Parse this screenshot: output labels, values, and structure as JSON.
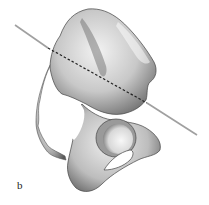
{
  "figure": {
    "panel_label": "b",
    "colors": {
      "background": "#ffffff",
      "bone_light": "#e8e8e8",
      "bone_mid": "#b8b8b8",
      "bone_dark": "#555555",
      "axis_line": "#a0a0a0",
      "axis_dashed": "#222222"
    },
    "axis": {
      "start": [
        15,
        25
      ],
      "end": [
        197,
        135
      ],
      "dashed_start": [
        48,
        48
      ],
      "dashed_end": [
        147,
        103
      ]
    }
  }
}
